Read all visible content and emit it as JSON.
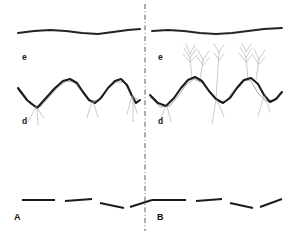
{
  "figure": {
    "width": 290,
    "height": 235,
    "background_color": "#ffffff",
    "ink_color": "#1c1c1c",
    "faint_ink_color": "#9a9a9a",
    "divider_color": "#4a4a4a"
  },
  "divider": {
    "name": "vertical-dash-dot-divider",
    "x": 145,
    "y_top": 4,
    "y_bottom": 231,
    "style": "dash-dot"
  },
  "panels": [
    {
      "id": "A",
      "label": "A",
      "label_x": 14,
      "label_y": 220,
      "layers": [
        {
          "name": "top-smooth-curve",
          "label": "e",
          "label_x": 22,
          "label_y": 60,
          "description": "gentle smooth undulating horizon line"
        },
        {
          "name": "middle-wavy-curve",
          "label": "d",
          "label_x": 22,
          "label_y": 124,
          "description": "thick wavy line with thin grey roots descending from troughs"
        },
        {
          "name": "bottom-dashed-line",
          "label": "",
          "description": "four short dark dash segments at varying angles"
        }
      ],
      "top_curve_points": "18,33 34,31 50,30 66,31 82,33 98,34 113,32 128,30 140,29",
      "wave_points": "18,88 27,100 37,108 46,98 55,88 63,81 70,79 77,83 83,92 89,100 95,103 101,98 108,88 115,81 121,79 127,85 132,96 136,103 140,100",
      "roots": [
        "36,107 28,122",
        "36,107 44,118",
        "37,108 38,125",
        "92,101 87,118",
        "93,101 98,117",
        "132,96 127,114",
        "132,96 137,113",
        "133,97 133,122"
      ],
      "thin_underlays": [
        "18,90 30,104 40,107 50,96 58,87 66,81 74,82 82,92 90,101 98,100 107,89 116,82 124,82 132,95 140,102"
      ],
      "bottom_dashes": [
        "22,200 55,200",
        "65,201 92,199",
        "100,203 124,208",
        "130,207 152,200"
      ]
    },
    {
      "id": "B",
      "label": "B",
      "label_x": 157,
      "label_y": 220,
      "layers": [
        {
          "name": "top-smooth-curve",
          "label": "e",
          "label_x": 158,
          "label_y": 60,
          "description": "gentle smooth undulating horizon line"
        },
        {
          "name": "middle-wavy-curve",
          "label": "d",
          "label_x": 158,
          "label_y": 124,
          "description": "thick wavy line with branching tree-like sprouts rising from crests"
        },
        {
          "name": "bottom-dashed-line",
          "label": "",
          "description": "four short dark dash segments at varying angles"
        }
      ],
      "top_curve_points": "152,31 168,30 184,31 200,33 216,34 232,33 248,31 264,29 282,28",
      "wave_points": "150,95 158,103 166,106 174,98 181,88 188,80 195,77 202,81 209,91 216,99 223,103 230,98 237,88 244,80 251,78 258,84 264,95 270,102 276,99 282,92",
      "sprouts": [
        {
          "base": "192,78",
          "trunk": "192,78 190,58",
          "branches": [
            "190,58 184,48",
            "190,58 196,49",
            "190,62 183,54",
            "190,62 197,55",
            "190,54 186,44",
            "190,54 195,45"
          ]
        },
        {
          "base": "200,80",
          "trunk": "200,80 203,60",
          "branches": [
            "203,60 198,50",
            "203,60 209,51",
            "203,65 197,57",
            "203,65 209,58"
          ]
        },
        {
          "base": "248,79",
          "trunk": "248,79 246,57",
          "branches": [
            "246,57 240,47",
            "246,57 252,48",
            "246,62 239,53",
            "246,62 253,54",
            "246,52 242,43",
            "246,52 251,44"
          ]
        },
        {
          "base": "256,80",
          "trunk": "256,80 259,59",
          "branches": [
            "259,59 254,49",
            "259,59 265,50",
            "259,64 253,56",
            "259,64 265,57"
          ]
        },
        {
          "base": "216,99",
          "trunk": "216,99 219,52",
          "branches": [
            "219,52 214,44",
            "219,52 224,45",
            "219,60 214,53",
            "219,60 224,54"
          ]
        }
      ],
      "roots": [
        "166,106 160,120",
        "167,106 171,122",
        "216,100 212,124",
        "217,100 224,117",
        "264,96 258,116",
        "265,96 270,112"
      ],
      "thin_underlays": [
        "150,97 160,107 170,106 178,96 186,85 194,79 202,83 210,93 218,102 226,101 234,90 242,81 250,80 258,93 266,101 274,100 282,93"
      ],
      "bottom_dashes": [
        "152,200 186,200",
        "196,201 222,199",
        "230,203 253,208",
        "260,207 282,199"
      ]
    }
  ]
}
